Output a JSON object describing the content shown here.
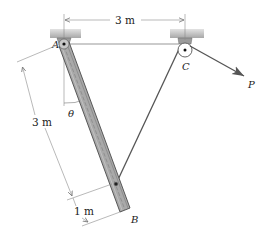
{
  "labels": {
    "pivot": "A",
    "pulley": "C",
    "bar_end": "B",
    "force": "P",
    "angle": "θ"
  },
  "dimensions": {
    "top_span": "3 m",
    "bar_upper": "3 m",
    "bar_lower": "1 m"
  },
  "colors": {
    "bar_fill": "#a9a9a9",
    "bar_edge": "#4a4a4a",
    "ceiling_fill": "#b8b8b8",
    "line": "#555555",
    "dim_line": "#8a8a8a",
    "text": "#1a1a1a"
  }
}
